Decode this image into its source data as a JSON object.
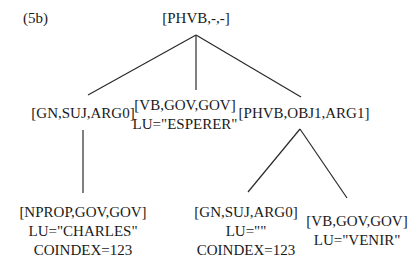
{
  "figure_label": "(5b)",
  "tree": {
    "root": {
      "lines": [
        "[PHVB,-,-]"
      ]
    },
    "children": [
      {
        "id": "gn_suj",
        "lines": [
          "[GN,SUJ,ARG0]"
        ]
      },
      {
        "id": "vb_esperer",
        "lines": [
          "[VB,GOV,GOV]",
          "LU=\"ESPERER\""
        ]
      },
      {
        "id": "phvb_obj1",
        "lines": [
          "[PHVB,OBJ1,ARG1]"
        ]
      }
    ],
    "grandchildren": [
      {
        "id": "nprop_charles",
        "parent": "gn_suj",
        "lines": [
          "[NPROP,GOV,GOV]",
          "LU=\"CHARLES\"",
          "COINDEX=123"
        ]
      },
      {
        "id": "gn_empty",
        "parent": "phvb_obj1",
        "lines": [
          "[GN,SUJ,ARG0]",
          "LU=\"\"",
          "COINDEX=123"
        ]
      },
      {
        "id": "vb_venir",
        "parent": "phvb_obj1",
        "lines": [
          "[VB,GOV,GOV]",
          "LU=\"VENIR\""
        ]
      }
    ]
  }
}
